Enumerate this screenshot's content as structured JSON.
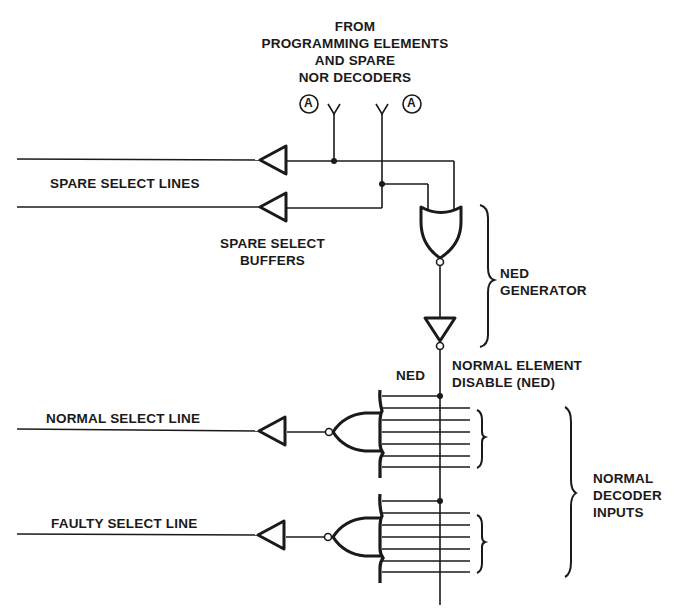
{
  "diagram": {
    "type": "logic-circuit",
    "source_label": {
      "lines": [
        "FROM",
        "PROGRAMMING ELEMENTS",
        "AND SPARE",
        "NOR DECODERS"
      ]
    },
    "connector_markers": [
      "A",
      "A"
    ],
    "labels": {
      "spare_select_lines": "SPARE SELECT LINES",
      "spare_select_buffers_1": "SPARE SELECT",
      "spare_select_buffers_2": "BUFFERS",
      "ned_generator_1": "NED",
      "ned_generator_2": "GENERATOR",
      "ned_short": "NED",
      "normal_element_disable_1": "NORMAL ELEMENT",
      "normal_element_disable_2": "DISABLE (NED)",
      "normal_select_line": "NORMAL SELECT LINE",
      "faulty_select_line": "FAULTY SELECT LINE",
      "normal_decoder_inputs_1": "NORMAL",
      "normal_decoder_inputs_2": "DECODER",
      "normal_decoder_inputs_3": "INPUTS"
    },
    "components": [
      {
        "id": "spare-buffer-1",
        "kind": "buffer"
      },
      {
        "id": "spare-buffer-2",
        "kind": "buffer"
      },
      {
        "id": "ned-nor-gate",
        "kind": "NOR"
      },
      {
        "id": "ned-inverter",
        "kind": "inverter"
      },
      {
        "id": "normal-decoder-nor",
        "kind": "NOR",
        "inputs": 7
      },
      {
        "id": "normal-select-buffer",
        "kind": "buffer"
      },
      {
        "id": "faulty-decoder-nor",
        "kind": "NOR",
        "inputs": 7
      },
      {
        "id": "faulty-select-buffer",
        "kind": "buffer"
      }
    ],
    "colors": {
      "ink": "#1a1a1a",
      "background": "#ffffff"
    }
  }
}
